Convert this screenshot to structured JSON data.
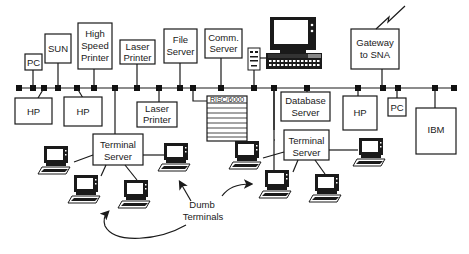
{
  "diagram": {
    "colors": {
      "ink": "#1a1a1a",
      "node": "#111111",
      "background": "#ffffff"
    },
    "devices": {
      "pc_left": {
        "label": "PC"
      },
      "sun": {
        "label": "SUN"
      },
      "high_speed_printer": {
        "line1": "High",
        "line2": "Speed",
        "line3": "Printer"
      },
      "laser_printer_top": {
        "line1": "Laser",
        "line2": "Printer"
      },
      "file_server": {
        "line1": "File",
        "line2": "Server"
      },
      "comm_server": {
        "line1": "Comm.",
        "line2": "Server"
      },
      "gateway": {
        "line1": "Gateway",
        "line2": "to SNA"
      },
      "hp_1": {
        "label": "HP"
      },
      "hp_2": {
        "label": "HP"
      },
      "laser_printer_bottom": {
        "line1": "Laser",
        "line2": "Printer"
      },
      "risc": {
        "label": "RISC/6000"
      },
      "database_server": {
        "line1": "Database",
        "line2": "Server"
      },
      "hp_3": {
        "label": "HP"
      },
      "pc_right": {
        "label": "PC"
      },
      "ibm": {
        "label": "IBM"
      },
      "terminal_server_left": {
        "line1": "Terminal",
        "line2": "Server"
      },
      "terminal_server_right": {
        "line1": "Terminal",
        "line2": "Server"
      }
    },
    "annotation": {
      "line1": "Dumb",
      "line2": "Terminals"
    }
  }
}
